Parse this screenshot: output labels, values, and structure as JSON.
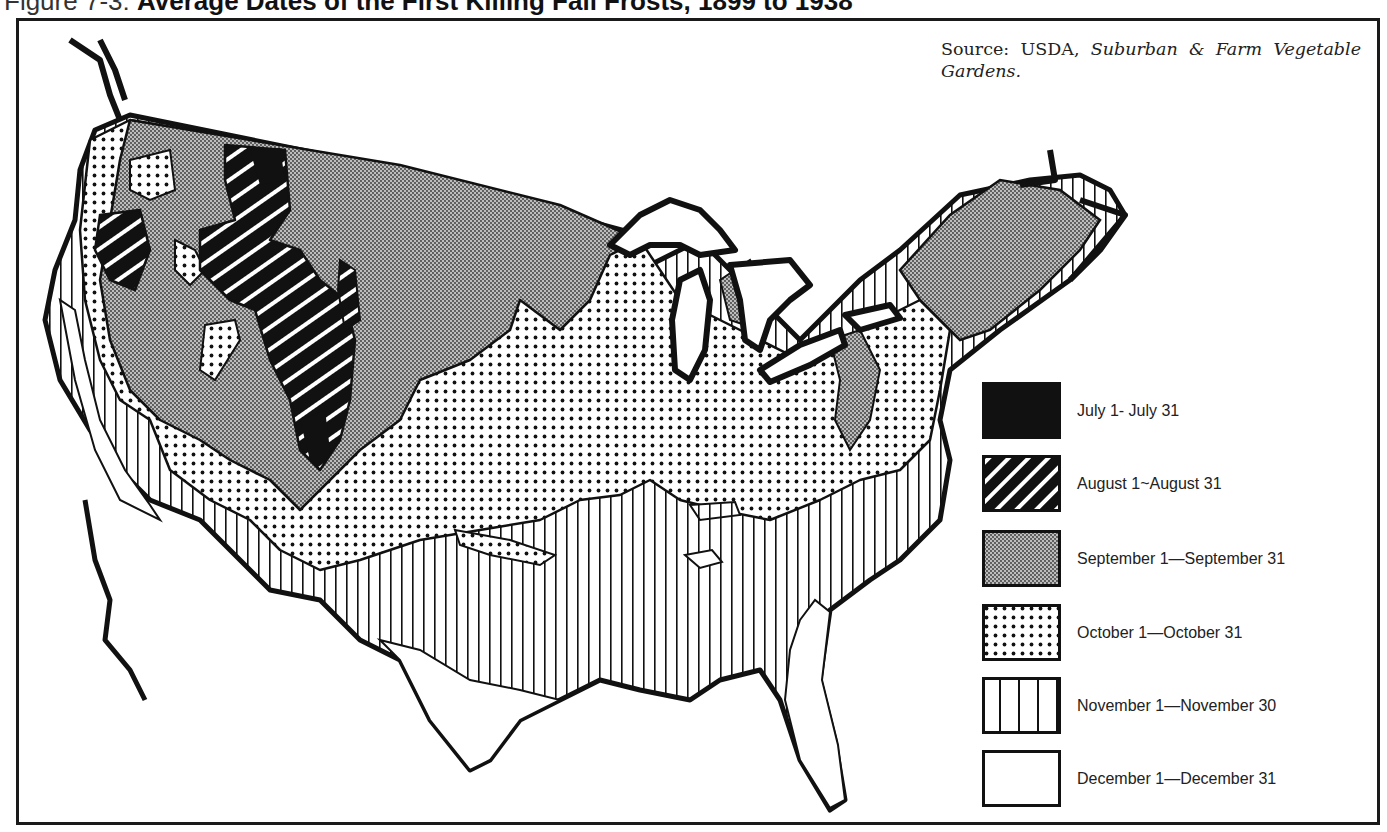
{
  "figure": {
    "prefix": "Figure 7-3:",
    "title": "Average Dates of the First Killing Fall Frosts, 1899 to 1938"
  },
  "source": {
    "label": "Source: USDA,",
    "publication": "Suburban & Farm Vegetable Gardens."
  },
  "map": {
    "region": "Contiguous United States",
    "features": [
      "Great Lakes",
      "Florida peninsula",
      "Gulf coast",
      "Pacific coast",
      "New England"
    ]
  },
  "legend": {
    "items": [
      {
        "label": "July 1- July 31",
        "pattern": "solid-black"
      },
      {
        "label": "August  1~August 31",
        "pattern": "diagonal-stripes"
      },
      {
        "label": "September  1—September 31",
        "pattern": "fine-dense-dots"
      },
      {
        "label": "October  1—October 31",
        "pattern": "coarse-dots"
      },
      {
        "label": "November  1—November  30",
        "pattern": "vertical-lines"
      },
      {
        "label": "December  1—December 31",
        "pattern": "blank-white"
      }
    ]
  },
  "colors": {
    "ink": "#111111",
    "paper": "#ffffff",
    "text": "#222222"
  }
}
